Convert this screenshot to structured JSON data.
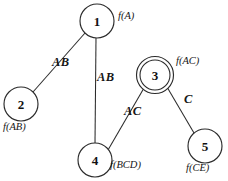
{
  "diagram": {
    "background_color": "#ffffff",
    "stroke_color": "#2b2b2b",
    "nodes": [
      {
        "id": "1",
        "label": "1",
        "cx": 97,
        "cy": 21,
        "r": 17,
        "double": false,
        "fn": "f(A)",
        "fn_x": 118,
        "fn_y": 11,
        "fn_anchor": "left"
      },
      {
        "id": "2",
        "label": "2",
        "cx": 21,
        "cy": 104,
        "r": 17,
        "double": false,
        "fn": "f(AB)",
        "fn_x": 3,
        "fn_y": 122,
        "fn_anchor": "left"
      },
      {
        "id": "3",
        "label": "3",
        "cx": 155,
        "cy": 75,
        "r": 15,
        "double": true,
        "fn": "f(AC)",
        "fn_x": 176,
        "fn_y": 56,
        "fn_anchor": "left"
      },
      {
        "id": "4",
        "label": "4",
        "cx": 95,
        "cy": 160,
        "r": 17,
        "double": false,
        "fn": "f(BCD)",
        "fn_x": 110,
        "fn_y": 160,
        "fn_anchor": "left"
      },
      {
        "id": "5",
        "label": "5",
        "cx": 205,
        "cy": 146,
        "r": 17,
        "double": false,
        "fn": "f(CE)",
        "fn_x": 186,
        "fn_y": 163,
        "fn_anchor": "left"
      }
    ],
    "edges": [
      {
        "from": "1",
        "to": "2",
        "label": "AB",
        "x1": 85,
        "y1": 33,
        "x2": 33,
        "y2": 92,
        "lx": 52,
        "ly": 56
      },
      {
        "from": "1",
        "to": "4",
        "label": "AB",
        "x1": 96,
        "y1": 38,
        "x2": 95,
        "y2": 143,
        "lx": 97,
        "ly": 71
      },
      {
        "from": "3",
        "to": "4",
        "label": "AC",
        "x1": 144,
        "y1": 88,
        "x2": 108,
        "y2": 150,
        "lx": 124,
        "ly": 105
      },
      {
        "from": "3",
        "to": "5",
        "label": "C",
        "x1": 167,
        "y1": 87,
        "x2": 194,
        "y2": 133,
        "lx": 184,
        "ly": 93
      }
    ]
  }
}
